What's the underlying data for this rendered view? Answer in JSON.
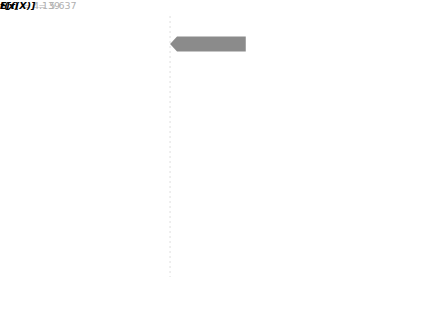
{
  "chart_data": {
    "type": "bar",
    "chart_kind": "shap-waterfall",
    "title": "",
    "xlabel": "",
    "ylabel": "",
    "xlim": [
      3.9,
      5.86
    ],
    "grid": false,
    "legend": false,
    "base_value_label": "E[f(X)]",
    "base_value": "5.637",
    "base_value_num": 5.637,
    "output_value_label": "f(x)",
    "output_value": "4.139",
    "output_value_num": 4.139,
    "xticks": [
      "4.00",
      "4.25",
      "4.50",
      "4.75",
      "5.00",
      "5.25",
      "5.50",
      "5.75"
    ],
    "xtick_values": [
      4.0,
      4.25,
      4.5,
      4.75,
      5.0,
      5.25,
      5.5,
      5.75
    ],
    "categories": [
      "total sulfur dioxide",
      "volatile acidity",
      "alcohol",
      "sulphates",
      "residual sugar",
      "chlorides",
      "fixed acidity",
      "density",
      "pH",
      "2 other features"
    ],
    "feature_values": [
      "9",
      "0.66",
      "9.4",
      "0.47",
      "1.6",
      "0.039",
      "7.7",
      "0.996",
      "3.4",
      ""
    ],
    "values": [
      -0.5,
      -0.34,
      -0.3,
      -0.27,
      -0.13,
      0.11,
      0.09,
      -0.09,
      -0.04,
      -0.04
    ],
    "value_labels": [
      "−0.5",
      "−0.34",
      "−0.3",
      "−0.27",
      "−0.13",
      "+0.11",
      "+0.09",
      "−0.09",
      "−0.04",
      "−0.04"
    ],
    "colors": {
      "negative_bar": "#8b8b8b",
      "positive_bar": "#565656",
      "axis": "#5a5a5a",
      "tick_text": "#3d3d3d",
      "feature_name": "#2b2b2b",
      "feature_value": "#c3c3c3",
      "inside_label": "#ffffff",
      "outside_neg_label": "#a9a9a9",
      "outside_pos_label": "#3a3a3a",
      "dashed_guide": "#dedede"
    }
  },
  "rows": [
    {
      "value": "9",
      "eq": " = ",
      "name": "total sulfur dioxide",
      "label": "−0.5"
    },
    {
      "value": "0.66",
      "eq": " = ",
      "name": "volatile acidity",
      "label": "−0.34"
    },
    {
      "value": "9.4",
      "eq": " = ",
      "name": "alcohol",
      "label": "−0.3"
    },
    {
      "value": "0.47",
      "eq": " = ",
      "name": "sulphates",
      "label": "−0.27"
    },
    {
      "value": "1.6",
      "eq": " = ",
      "name": "residual sugar",
      "label": "−0.13"
    },
    {
      "value": "0.039",
      "eq": " = ",
      "name": "chlorides",
      "label": "+0.11"
    },
    {
      "value": "7.7",
      "eq": " = ",
      "name": "fixed acidity",
      "label": "+0.09"
    },
    {
      "value": "0.996",
      "eq": " = ",
      "name": "density",
      "label": "−0.09"
    },
    {
      "value": "3.4",
      "eq": " = ",
      "name": "pH",
      "label": "−0.04"
    },
    {
      "value": "",
      "eq": "",
      "name": "2 other features",
      "label": "−0.04"
    }
  ],
  "axis": {
    "fx_prefix": "f(x)",
    "fx_eq": " = ",
    "fx_value": "4.139",
    "efx_prefix": "E[f(X)]",
    "efx_eq": " = ",
    "efx_value": "5.637"
  }
}
